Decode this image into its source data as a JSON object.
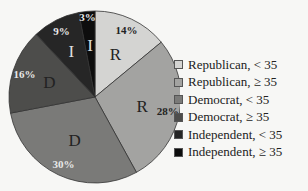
{
  "chart_data": {
    "type": "pie",
    "title": "",
    "start_angle": "12 o'clock, clockwise",
    "slices": [
      {
        "label": "Republican, < 35",
        "value": 14,
        "pct_label": "14%",
        "inner_label": "R",
        "color": "#d4d4d2"
      },
      {
        "label": "Republican, ≥ 35",
        "value": 28,
        "pct_label": "28%",
        "inner_label": "R",
        "color": "#a3a3a1"
      },
      {
        "label": "Democrat, < 35",
        "value": 30,
        "pct_label": "30%",
        "inner_label": "D",
        "color": "#7a7a78"
      },
      {
        "label": "Democrat, ≥ 35",
        "value": 16,
        "pct_label": "16%",
        "inner_label": "D",
        "color": "#4d4d4b"
      },
      {
        "label": "Independent, < 35",
        "value": 9,
        "pct_label": "9%",
        "inner_label": "I",
        "color": "#262626"
      },
      {
        "label": "Independent, ≥ 35",
        "value": 3,
        "pct_label": "3%",
        "inner_label": "I",
        "color": "#0d0d0d"
      }
    ],
    "legend_position": "right"
  },
  "legend": {
    "items": [
      {
        "label": "Republican, < 35",
        "color": "#d4d4d2"
      },
      {
        "label": "Republican, ≥ 35",
        "color": "#a3a3a1"
      },
      {
        "label": "Democrat, < 35",
        "color": "#7a7a78"
      },
      {
        "label": "Democrat, ≥ 35",
        "color": "#4d4d4b"
      },
      {
        "label": "Independent, < 35",
        "color": "#262626"
      },
      {
        "label": "Independent, ≥ 35",
        "color": "#0d0d0d"
      }
    ]
  }
}
